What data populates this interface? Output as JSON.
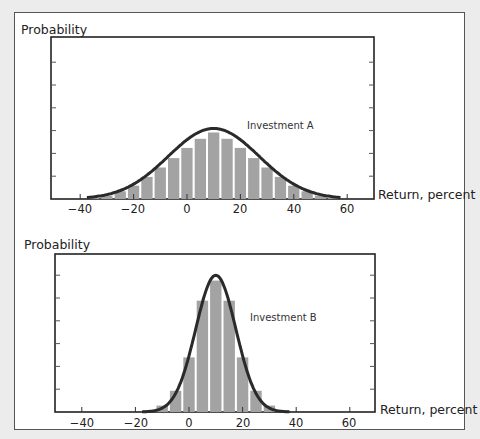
{
  "chart_data": [
    {
      "type": "bar",
      "title": "Investment A",
      "annotation": "Investment A",
      "ylabel": "Probability",
      "xlabel": "Return, percent",
      "x_ticks": [
        -40,
        -20,
        0,
        20,
        40,
        60
      ],
      "xlim": [
        -50,
        70
      ],
      "grid": false,
      "legend": "none",
      "overlay": "normal curve",
      "bin_width": 5,
      "categories": [
        -35,
        -30,
        -25,
        -20,
        -15,
        -10,
        -5,
        0,
        5,
        10,
        15,
        20,
        25,
        30,
        35,
        40,
        45,
        50,
        55
      ],
      "values": [
        0.3,
        1.0,
        2.2,
        3.8,
        6.3,
        9.0,
        11.7,
        14.6,
        17.2,
        19.0,
        17.2,
        14.6,
        11.7,
        9.0,
        6.3,
        3.8,
        2.2,
        1.0,
        0.3
      ],
      "curve": {
        "mean": 10,
        "std": 17
      }
    },
    {
      "type": "bar",
      "title": "Investment B",
      "annotation": "Investment B",
      "ylabel": "Probability",
      "xlabel": "Return, percent",
      "x_ticks": [
        -40,
        -20,
        0,
        20,
        40,
        60
      ],
      "xlim": [
        -50,
        70
      ],
      "grid": false,
      "legend": "none",
      "overlay": "normal curve",
      "bin_width": 5,
      "categories": [
        -15,
        -10,
        -5,
        0,
        5,
        10,
        15,
        20,
        25,
        30,
        35
      ],
      "values": [
        0.3,
        1.2,
        4.0,
        10.3,
        21.0,
        24.8,
        21.0,
        10.3,
        4.0,
        1.2,
        0.3
      ],
      "curve": {
        "mean": 10,
        "std": 7.5
      }
    }
  ],
  "chart_a": {
    "ylabel": "Probability",
    "xlabel": "Return, percent",
    "annotation": "Investment A",
    "ticks": [
      "−40",
      "−20",
      "0",
      "20",
      "40",
      "60"
    ]
  },
  "chart_b": {
    "ylabel": "Probability",
    "xlabel": "Return, percent",
    "annotation": "Investment B",
    "ticks": [
      "−40",
      "−20",
      "0",
      "20",
      "40",
      "60"
    ]
  }
}
